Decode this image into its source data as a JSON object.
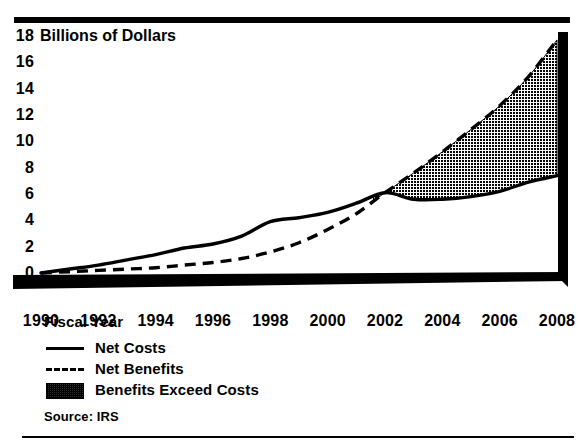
{
  "figure": {
    "source_note": "Source: IRS"
  },
  "chart_data": {
    "type": "line",
    "title": "",
    "ylabel": "Billions of Dollars",
    "xlabel": "Fiscal Year",
    "ylim": [
      0,
      18
    ],
    "xlim": [
      1990,
      2008
    ],
    "grid": false,
    "y_ticks": [
      18,
      16,
      14,
      12,
      10,
      8,
      6,
      4,
      2,
      0
    ],
    "y_tick_labels": [
      "18",
      "16",
      "14",
      "12",
      "10",
      "8",
      "6",
      "4",
      "2",
      "0"
    ],
    "x_ticks": [
      1990,
      1992,
      1994,
      1996,
      1998,
      2000,
      2002,
      2004,
      2006,
      2008
    ],
    "x_tick_labels": [
      "1990",
      "1992",
      "1994",
      "1996",
      "1998",
      "2000",
      "2002",
      "2004",
      "2006",
      "2008"
    ],
    "x": [
      1990,
      1991,
      1992,
      1993,
      1994,
      1995,
      1996,
      1997,
      1998,
      1999,
      2000,
      2001,
      2002,
      2003,
      2004,
      2005,
      2006,
      2007,
      2008
    ],
    "series": [
      {
        "name": "Net Costs",
        "style": "solid",
        "values": [
          0.0,
          0.3,
          0.6,
          1.0,
          1.4,
          1.9,
          2.2,
          2.8,
          3.9,
          4.2,
          4.6,
          5.3,
          6.1,
          5.6,
          5.6,
          5.8,
          6.2,
          6.9,
          7.4
        ]
      },
      {
        "name": "Net Benefits",
        "style": "dashed",
        "values": [
          0.0,
          0.1,
          0.2,
          0.3,
          0.4,
          0.6,
          0.8,
          1.1,
          1.6,
          2.3,
          3.3,
          4.5,
          6.1,
          7.6,
          9.2,
          10.9,
          12.7,
          14.9,
          17.7
        ]
      }
    ],
    "fill_between": {
      "name": "Benefits Exceed Costs",
      "upper_series": "Net Benefits",
      "lower_series": "Net Costs",
      "start_x": 2001.6,
      "end_x": 2008,
      "pattern": "cross-hatch"
    },
    "legend": {
      "position": "below-axes-left",
      "title": "Fiscal Year",
      "entries": [
        {
          "label": "Net Costs",
          "key": "solid-line"
        },
        {
          "label": "Net Benefits",
          "key": "dashed-line"
        },
        {
          "label": "Benefits Exceed Costs",
          "key": "hatch-swatch"
        }
      ]
    }
  }
}
